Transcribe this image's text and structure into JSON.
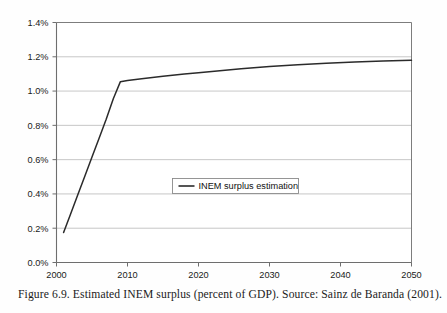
{
  "figure": {
    "caption": "Figure 6.9.  Estimated INEM surplus (percent of GDP). Source: Sainz de Baranda (2001).",
    "background_color": "#fefefe"
  },
  "chart_data": {
    "type": "line",
    "title": "",
    "xlabel": "",
    "ylabel": "",
    "xlim": [
      2000,
      2050
    ],
    "ylim": [
      0.0,
      1.4
    ],
    "grid": true,
    "grid_axis": "y",
    "legend_position": "center",
    "axis_color": "#6e6e6e",
    "grid_color": "#b9b9b9",
    "line_color": "#2b2b2b",
    "xticks": [
      2000,
      2010,
      2020,
      2030,
      2040,
      2050
    ],
    "xtick_labels": [
      "2000",
      "2010",
      "2020",
      "2030",
      "2040",
      "2050"
    ],
    "yticks": [
      0.0,
      0.2,
      0.4,
      0.6,
      0.8,
      1.0,
      1.2,
      1.4
    ],
    "ytick_labels": [
      "0.0%",
      "0.2%",
      "0.4%",
      "0.6%",
      "0.8%",
      "1.0%",
      "1.2%",
      "1.4%"
    ],
    "series": [
      {
        "name": "INEM surplus estimation",
        "color": "#2b2b2b",
        "x": [
          2001,
          2002,
          2003,
          2004,
          2005,
          2006,
          2007,
          2008,
          2009,
          2010,
          2012,
          2015,
          2018,
          2020,
          2023,
          2026,
          2030,
          2034,
          2038,
          2042,
          2046,
          2050
        ],
        "values": [
          0.175,
          0.285,
          0.395,
          0.505,
          0.615,
          0.725,
          0.835,
          0.955,
          1.055,
          1.062,
          1.072,
          1.086,
          1.099,
          1.107,
          1.119,
          1.13,
          1.143,
          1.154,
          1.163,
          1.17,
          1.176,
          1.18
        ]
      }
    ],
    "legend": {
      "entries": [
        {
          "label": "INEM surplus estimation",
          "marker": "line",
          "color": "#2b2b2b"
        }
      ]
    }
  }
}
